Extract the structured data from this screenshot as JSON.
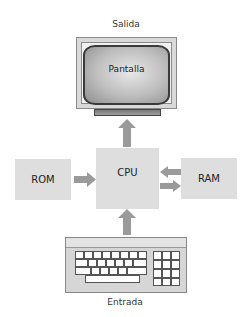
{
  "diagram": {
    "output_label": "Salida",
    "screen_label": "Pantalla",
    "cpu_label": "CPU",
    "rom_label": "ROM",
    "ram_label": "RAM",
    "input_label": "Entrada"
  },
  "colors": {
    "box_fill": "#dedede",
    "arrow": "#9a9a9a",
    "background": "#ffffff"
  },
  "connections": [
    {
      "from": "ROM",
      "to": "CPU"
    },
    {
      "from": "RAM",
      "to": "CPU"
    },
    {
      "from": "CPU",
      "to": "RAM"
    },
    {
      "from": "CPU",
      "to": "Pantalla"
    },
    {
      "from": "Entrada",
      "to": "CPU"
    }
  ]
}
